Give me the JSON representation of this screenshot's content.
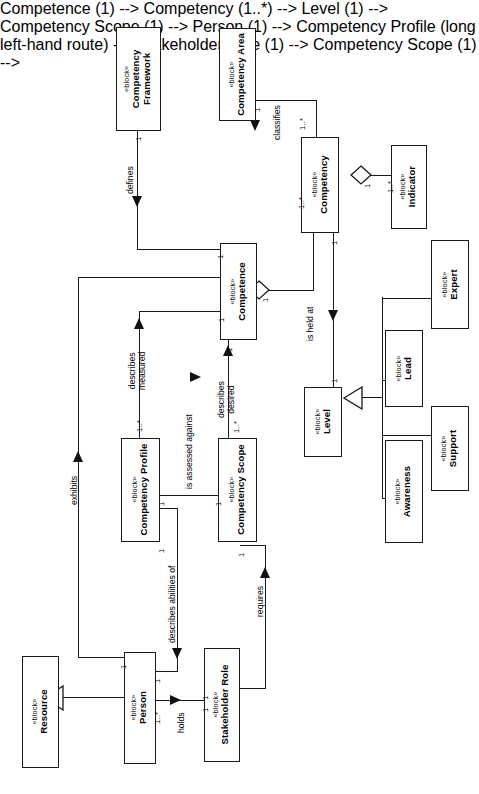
{
  "diagram": {
    "kind": "SysML Block Definition Diagram",
    "orientation": "rotated-90-ccw",
    "stereotype": "«block»",
    "line_color": "#1a1a1a",
    "fill_color": "#ffffff",
    "text_color": "#000000"
  },
  "blocks": {
    "competency_framework": {
      "stereotype": "«block»",
      "line1": "Competency",
      "line2": "Framework"
    },
    "competency_area": {
      "stereotype": "«block»",
      "line1": "Competency Area",
      "line2": ""
    },
    "competency": {
      "stereotype": "«block»",
      "line1": "Competency",
      "line2": ""
    },
    "indicator": {
      "stereotype": "«block»",
      "line1": "Indicator",
      "line2": ""
    },
    "competence": {
      "stereotype": "«block»",
      "line1": "Competence",
      "line2": ""
    },
    "level": {
      "stereotype": "«block»",
      "line1": "Level",
      "line2": ""
    },
    "expert": {
      "stereotype": "«block»",
      "line1": "Expert",
      "line2": ""
    },
    "lead": {
      "stereotype": "«block»",
      "line1": "Lead",
      "line2": ""
    },
    "support": {
      "stereotype": "«block»",
      "line1": "Support",
      "line2": ""
    },
    "awareness": {
      "stereotype": "«block»",
      "line1": "Awareness",
      "line2": ""
    },
    "competency_profile": {
      "stereotype": "«block»",
      "line1": "Competency Profile",
      "line2": ""
    },
    "competency_scope": {
      "stereotype": "«block»",
      "line1": "Competency Scope",
      "line2": ""
    },
    "resource": {
      "stereotype": "«block»",
      "line1": "Resource",
      "line2": ""
    },
    "person": {
      "stereotype": "«block»",
      "line1": "Person",
      "line2": ""
    },
    "stakeholder_role": {
      "stereotype": "«block»",
      "line1": "Stakeholder Role",
      "line2": ""
    }
  },
  "associations": {
    "defines": {
      "label": "defines"
    },
    "classifies": {
      "label": "classifies"
    },
    "is_held_at": {
      "label": "is held at"
    },
    "describes_measured": {
      "label_line1": "describes",
      "label_line2": "measured"
    },
    "describes_desired": {
      "label_line1": "describes",
      "label_line2": "desired"
    },
    "is_assessed_against": {
      "label": "is assessed against"
    },
    "describes_abilities_of": {
      "label": "describes abilities of"
    },
    "exhibits": {
      "label": "exhibits"
    },
    "holds": {
      "label": "holds"
    },
    "requires": {
      "label": "requires"
    }
  },
  "multiplicities": {
    "framework_end": "1",
    "competence_from_fw": "1",
    "area_end": "1",
    "competency_from_area": "1..*",
    "competency_agg_end": "1",
    "indicator_end": "1..*",
    "competence_agg_end": "1",
    "competency_to_competence": "1..*",
    "competency_level_end": "1",
    "level_end": "1",
    "competence_measured_end": "1",
    "profile_measured_end": "1..*",
    "competence_desired_end": "1",
    "scope_desired_end": "1..*",
    "profile_assessed_end": "1",
    "scope_assessed_end": "1",
    "profile_person_end": "1",
    "person_profile_end": "1",
    "resource_person_end": "1",
    "person_exhibits_end": "1",
    "person_holds_end": "1..*",
    "role_holds_end": "1",
    "scope_requires_end": "1",
    "role_requires_end": "1"
  }
}
